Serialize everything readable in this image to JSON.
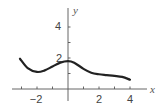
{
  "chart_data": {
    "type": "line",
    "title": "",
    "xlabel": "x",
    "ylabel": "y",
    "xlim": [
      -3.2,
      5
    ],
    "ylim": [
      0,
      5
    ],
    "grid": false,
    "legend": null,
    "x_ticks": [
      -3,
      -2,
      -1,
      1,
      2,
      3,
      4
    ],
    "x_tick_labels": [
      "-2",
      "2",
      "4"
    ],
    "x_tick_label_values": [
      -2,
      2,
      4
    ],
    "y_ticks": [
      1,
      2,
      3,
      4
    ],
    "y_tick_labels": [
      "2",
      "4"
    ],
    "y_tick_label_values": [
      2,
      4
    ],
    "series": [
      {
        "name": "f(x)",
        "x": [
          -3.1,
          -2.6,
          -2.0,
          -1.5,
          -1.0,
          -0.5,
          0.0,
          0.4,
          1.0,
          1.5,
          2.0,
          2.5,
          3.0,
          3.5,
          4.0
        ],
        "y": [
          1.95,
          1.35,
          1.1,
          1.2,
          1.45,
          1.7,
          1.8,
          1.7,
          1.3,
          1.05,
          0.95,
          0.9,
          0.85,
          0.78,
          0.6
        ]
      }
    ]
  },
  "labels": {
    "x_axis": "x",
    "y_axis": "y",
    "x_neg2": "−2",
    "x_2": "2",
    "x_4": "4",
    "y_2": "2",
    "y_4": "4"
  },
  "colors": {
    "curve": "#222222",
    "axis": "#555555"
  }
}
